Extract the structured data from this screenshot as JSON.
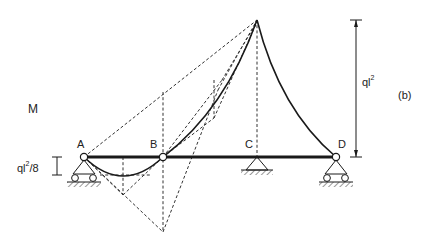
{
  "diagram": {
    "figure_label": "(b)",
    "quantity_label": "M",
    "nodes": [
      {
        "id": "A",
        "label": "A",
        "support": "roller"
      },
      {
        "id": "B",
        "label": "B",
        "support": "hinge"
      },
      {
        "id": "C",
        "label": "C",
        "support": "pin"
      },
      {
        "id": "D",
        "label": "D",
        "support": "roller"
      }
    ],
    "dimensions": {
      "peak_moment": {
        "base": "ql",
        "exp": "2"
      },
      "span_moment": {
        "base": "ql",
        "exp": "2",
        "suffix": "/8"
      }
    },
    "colors": {
      "line": "#1a1a1a",
      "background": "#ffffff"
    }
  }
}
